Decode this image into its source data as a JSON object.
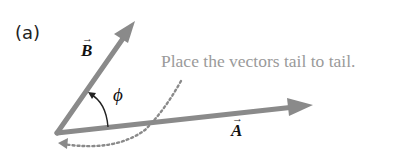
{
  "figure": {
    "panel_label": "(a)",
    "instruction": "Place the vectors tail to tail.",
    "vectors": [
      {
        "name": "A",
        "label": "A",
        "arrow": "→",
        "tail": [
          57,
          133
        ],
        "tip": [
          313,
          105
        ]
      },
      {
        "name": "B",
        "label": "B",
        "arrow": "→",
        "tail": [
          57,
          133
        ],
        "tip": [
          135,
          21
        ]
      }
    ],
    "angle_label": "ϕ",
    "colors": {
      "vector": "#8a8a8a",
      "instruction_text": "#9a9a9a",
      "dotted_path": "#8a8a8a",
      "labels": "#111111"
    }
  }
}
